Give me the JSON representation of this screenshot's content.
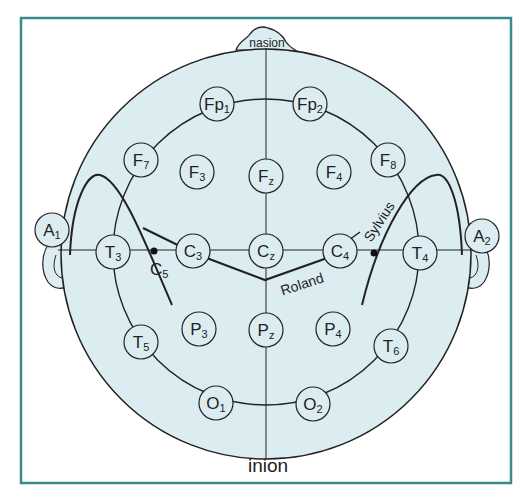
{
  "colors": {
    "frame": "#3a8a8c",
    "head_fill": "#dcedf1",
    "line": "#222222"
  },
  "landmarks": {
    "top": "nasion",
    "bottom": "inion"
  },
  "sulci": {
    "central": "Roland",
    "lateral": "Sylvius"
  },
  "electrodes": [
    {
      "id": "Fp1",
      "base": "Fp",
      "sub": "1"
    },
    {
      "id": "Fp2",
      "base": "Fp",
      "sub": "2"
    },
    {
      "id": "F7",
      "base": "F",
      "sub": "7"
    },
    {
      "id": "F3",
      "base": "F",
      "sub": "3"
    },
    {
      "id": "Fz",
      "base": "F",
      "sub": "z"
    },
    {
      "id": "F4",
      "base": "F",
      "sub": "4"
    },
    {
      "id": "F8",
      "base": "F",
      "sub": "8"
    },
    {
      "id": "A1",
      "base": "A",
      "sub": "1"
    },
    {
      "id": "T3",
      "base": "T",
      "sub": "3"
    },
    {
      "id": "C3",
      "base": "C",
      "sub": "3"
    },
    {
      "id": "Cz",
      "base": "C",
      "sub": "z"
    },
    {
      "id": "C4",
      "base": "C",
      "sub": "4"
    },
    {
      "id": "T4",
      "base": "T",
      "sub": "4"
    },
    {
      "id": "A2",
      "base": "A",
      "sub": "2"
    },
    {
      "id": "T5",
      "base": "T",
      "sub": "5"
    },
    {
      "id": "P3",
      "base": "P",
      "sub": "3"
    },
    {
      "id": "Pz",
      "base": "P",
      "sub": "z"
    },
    {
      "id": "P4",
      "base": "P",
      "sub": "4"
    },
    {
      "id": "T6",
      "base": "T",
      "sub": "6"
    },
    {
      "id": "O1",
      "base": "O",
      "sub": "1"
    },
    {
      "id": "O2",
      "base": "O",
      "sub": "2"
    }
  ],
  "points": [
    {
      "id": "C5",
      "base": "C",
      "sub": "5"
    },
    {
      "id": "C6",
      "base": "",
      "sub": ""
    }
  ]
}
